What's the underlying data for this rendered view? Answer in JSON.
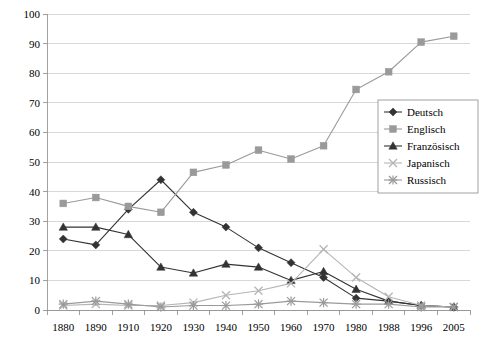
{
  "chart_data": {
    "type": "line",
    "title": "",
    "subtitle": "",
    "xlabel": "",
    "ylabel": "",
    "categories": [
      "1880",
      "1890",
      "1910",
      "1920",
      "1930",
      "1940",
      "1950",
      "1960",
      "1970",
      "1980",
      "1988",
      "1996",
      "2005"
    ],
    "x": [
      1880,
      1890,
      1910,
      1920,
      1930,
      1940,
      1950,
      1960,
      1970,
      1980,
      1988,
      1996,
      2005
    ],
    "ylim": [
      0,
      100
    ],
    "yticks": [
      0,
      10,
      20,
      30,
      40,
      50,
      60,
      70,
      80,
      90,
      100
    ],
    "grid": "horizontal",
    "legend_position": "right",
    "series": [
      {
        "name": "Deutsch",
        "marker": "diamond",
        "color": "#333333",
        "values": [
          24,
          22,
          34,
          44,
          33,
          28,
          21,
          16,
          11,
          4,
          3,
          1.5,
          1
        ]
      },
      {
        "name": "Englisch",
        "marker": "square",
        "color": "#9a9a9a",
        "values": [
          36,
          38,
          35,
          33,
          46.5,
          49,
          54,
          51,
          55.5,
          74.5,
          80.5,
          90.5,
          92.5
        ]
      },
      {
        "name": "Französisch",
        "marker": "triangle",
        "color": "#333333",
        "values": [
          28,
          28,
          25.5,
          14.5,
          12.5,
          15.5,
          14.5,
          10,
          13,
          7,
          3,
          1.5,
          1
        ]
      },
      {
        "name": "Japanisch",
        "marker": "x",
        "color": "#b5b5b5",
        "values": [
          1.5,
          2,
          1.5,
          1.5,
          2.5,
          5,
          6.5,
          9,
          20.5,
          11,
          4.5,
          1.5,
          1
        ]
      },
      {
        "name": "Russisch",
        "marker": "asterisk",
        "color": "#9a9a9a",
        "values": [
          2,
          3,
          2,
          1,
          1.5,
          1.5,
          2,
          3,
          2.5,
          2,
          2,
          1,
          1
        ]
      }
    ]
  },
  "legend": {
    "entries": [
      {
        "label": "Deutsch"
      },
      {
        "label": "Englisch"
      },
      {
        "label": "Französisch"
      },
      {
        "label": "Japanisch"
      },
      {
        "label": "Russisch"
      }
    ]
  },
  "axes": {
    "y_tick_labels": [
      "100",
      "90",
      "80",
      "70",
      "60",
      "50",
      "40",
      "30",
      "20",
      "10",
      "0"
    ],
    "x_tick_labels": [
      "1880",
      "1890",
      "1910",
      "1920",
      "1930",
      "1940",
      "1950",
      "1960",
      "1970",
      "1980",
      "1988",
      "1996",
      "2005"
    ]
  }
}
